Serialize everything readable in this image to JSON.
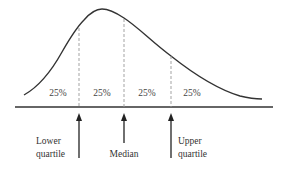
{
  "diagram": {
    "type": "quartile-distribution",
    "segments": [
      {
        "label": "25%"
      },
      {
        "label": "25%"
      },
      {
        "label": "25%"
      },
      {
        "label": "25%"
      }
    ],
    "markers": [
      {
        "id": "lower-quartile",
        "line1": "Lower",
        "line2": "quartile"
      },
      {
        "id": "median",
        "line1": "Median"
      },
      {
        "id": "upper-quartile",
        "line1": "Upper",
        "line2": "quartile"
      }
    ],
    "colors": {
      "curve": "#333333",
      "axis": "#333333",
      "dashed": "#999999",
      "text": "#333333"
    }
  }
}
